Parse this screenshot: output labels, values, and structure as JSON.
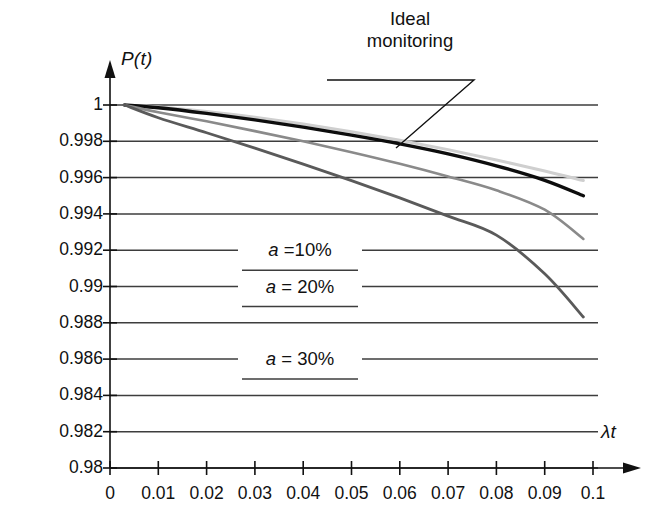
{
  "chart_data": {
    "type": "line",
    "title": "",
    "xlabel": "λt",
    "ylabel": "P(t)",
    "xlim": [
      0,
      0.1
    ],
    "ylim": [
      0.98,
      1
    ],
    "grid": true,
    "legend_position": "inside-center",
    "xticks": [
      "0",
      "0.01",
      "0.02",
      "0.03",
      "0.04",
      "0.05",
      "0.06",
      "0.07",
      "0.08",
      "0.09",
      "0.1"
    ],
    "xtick_values": [
      0,
      0.01,
      0.02,
      0.03,
      0.04,
      0.05,
      0.06,
      0.07,
      0.08,
      0.09,
      0.1
    ],
    "yticks": [
      "1",
      "0.998",
      "0.996",
      "0.994",
      "0.992",
      "0.99",
      "0.988",
      "0.986",
      "0.984",
      "0.982",
      "0.98"
    ],
    "ytick_values": [
      1,
      0.998,
      0.996,
      0.994,
      0.992,
      0.99,
      0.988,
      0.986,
      0.984,
      0.982,
      0.98
    ],
    "x": [
      0.003,
      0.01,
      0.02,
      0.03,
      0.04,
      0.05,
      0.06,
      0.07,
      0.08,
      0.09,
      0.098
    ],
    "series": [
      {
        "name": "Ideal monitoring",
        "color": "#cfcfcf",
        "width": 3.0,
        "values": [
          1.0,
          0.99989,
          0.99964,
          0.99932,
          0.99895,
          0.99853,
          0.99806,
          0.99754,
          0.99697,
          0.99636,
          0.99584
        ]
      },
      {
        "name": "a = 10%",
        "color": "#0d0d0d",
        "width": 3.4,
        "values": [
          1.0,
          0.99985,
          0.99954,
          0.99918,
          0.99878,
          0.99834,
          0.99786,
          0.99731,
          0.99665,
          0.99585,
          0.995
        ]
      },
      {
        "name": "a = 20%",
        "color": "#8a8a8a",
        "width": 2.6,
        "values": [
          1.0,
          0.9996,
          0.9991,
          0.99856,
          0.998,
          0.9974,
          0.99676,
          0.99606,
          0.9953,
          0.99423,
          0.99262
        ]
      },
      {
        "name": "a = 30%",
        "color": "#5a5a5a",
        "width": 2.8,
        "values": [
          1.0,
          0.9993,
          0.99847,
          0.99762,
          0.99674,
          0.99583,
          0.99488,
          0.99388,
          0.99283,
          0.9907,
          0.98832
        ]
      }
    ],
    "annotations": [
      {
        "text": "Ideal\nmonitoring",
        "line1": "Ideal",
        "line2": "monitoring"
      }
    ],
    "legend_entries": [
      {
        "a_symbol": "a",
        "rest": " =10%",
        "at_y": 0.992
      },
      {
        "a_symbol": "a",
        "rest": " = 20%",
        "at_y": 0.99
      },
      {
        "a_symbol": "a",
        "rest": " = 30%",
        "at_y": 0.986
      }
    ]
  }
}
